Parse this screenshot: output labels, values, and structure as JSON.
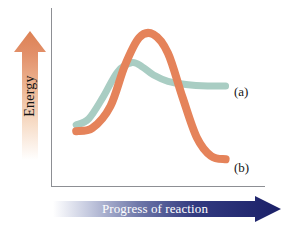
{
  "figure": {
    "background": "#ffffff",
    "width": 285,
    "height": 226
  },
  "axes": {
    "y_title": "Energy",
    "x_title": "Progress of reaction",
    "line_color": "#8d8f94",
    "y_arrow_color_top": "#e08a5e",
    "y_arrow_color_bottom": "#ffffff",
    "x_arrow_color_right": "#20246b",
    "x_arrow_color_left": "#ffffff"
  },
  "legend": {
    "a_label": "(a)",
    "b_label": "(b)"
  },
  "chart_data": {
    "type": "line",
    "title": "",
    "xlabel": "Progress of reaction",
    "ylabel": "Energy",
    "grid": false,
    "axis_ticks": false,
    "legend_position": "right-inline",
    "xlim": [
      0,
      1
    ],
    "ylim": [
      0,
      1
    ],
    "annotations": [
      "(a)",
      "(b)"
    ],
    "series": [
      {
        "name": "(a)",
        "label": "(a)",
        "color": "#a9cdc3",
        "line_width": 7,
        "description": "Catalyzed pathway: lower activation energy barrier, product energy level flat and higher than (b)",
        "x": [
          0.09,
          0.16,
          0.24,
          0.32,
          0.4,
          0.46,
          0.52,
          0.6,
          0.7,
          0.82,
          0.92
        ],
        "y": [
          0.34,
          0.38,
          0.52,
          0.68,
          0.74,
          0.71,
          0.66,
          0.62,
          0.6,
          0.59,
          0.59
        ]
      },
      {
        "name": "(b)",
        "label": "(b)",
        "color": "#e5835a",
        "line_width": 8,
        "description": "Uncatalyzed pathway: higher activation energy barrier, product energy level drops low",
        "x": [
          0.09,
          0.18,
          0.28,
          0.36,
          0.44,
          0.52,
          0.6,
          0.68,
          0.76,
          0.84,
          0.92
        ],
        "y": [
          0.3,
          0.32,
          0.46,
          0.72,
          0.9,
          0.92,
          0.8,
          0.52,
          0.26,
          0.14,
          0.12
        ]
      }
    ]
  }
}
